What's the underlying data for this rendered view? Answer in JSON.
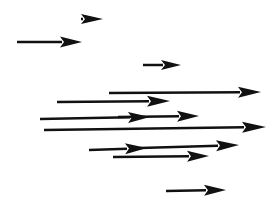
{
  "diagram": {
    "title": "",
    "background": "#ffffff",
    "stroke_color": "#111111",
    "arrows": [
      {
        "id": "a1",
        "x1": 81,
        "y1": 19,
        "x2": 103,
        "y2": 19,
        "width": 2.5,
        "head_len": 22,
        "head_w": 10
      },
      {
        "id": "a2",
        "x1": 17,
        "y1": 42,
        "x2": 82,
        "y2": 42,
        "width": 2.5,
        "head_len": 22,
        "head_w": 11
      },
      {
        "id": "a3",
        "x1": 143,
        "y1": 65,
        "x2": 181,
        "y2": 65,
        "width": 2.5,
        "head_len": 20,
        "head_w": 10
      },
      {
        "id": "a4",
        "x1": 109,
        "y1": 93,
        "x2": 261,
        "y2": 92,
        "width": 2.5,
        "head_len": 23,
        "head_w": 11
      },
      {
        "id": "a5",
        "x1": 57,
        "y1": 102,
        "x2": 170,
        "y2": 101,
        "width": 2.5,
        "head_len": 23,
        "head_w": 11
      },
      {
        "id": "a6",
        "x1": 40,
        "y1": 119,
        "x2": 150,
        "y2": 117,
        "width": 2.5,
        "head_len": 22,
        "head_w": 11
      },
      {
        "id": "a7",
        "x1": 118,
        "y1": 117,
        "x2": 199,
        "y2": 116,
        "width": 2.5,
        "head_len": 22,
        "head_w": 11
      },
      {
        "id": "a8",
        "x1": 44,
        "y1": 130,
        "x2": 266,
        "y2": 127,
        "width": 2.5,
        "head_len": 24,
        "head_w": 11
      },
      {
        "id": "a9",
        "x1": 89,
        "y1": 150,
        "x2": 147,
        "y2": 148,
        "width": 2.5,
        "head_len": 22,
        "head_w": 11
      },
      {
        "id": "a10",
        "x1": 140,
        "y1": 148,
        "x2": 239,
        "y2": 145,
        "width": 2.5,
        "head_len": 23,
        "head_w": 11
      },
      {
        "id": "a11",
        "x1": 113,
        "y1": 157,
        "x2": 209,
        "y2": 156,
        "width": 2.5,
        "head_len": 22,
        "head_w": 11
      },
      {
        "id": "a12",
        "x1": 166,
        "y1": 191,
        "x2": 226,
        "y2": 190,
        "width": 2.5,
        "head_len": 22,
        "head_w": 11
      }
    ]
  }
}
